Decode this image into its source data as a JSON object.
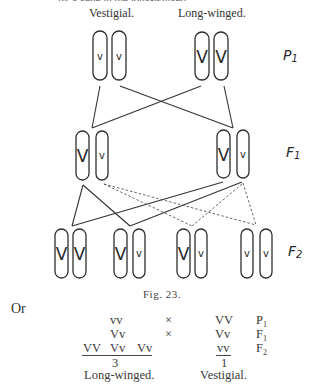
{
  "header": {
    "truncated_line": "...by a gene in the long-winged, ...",
    "left_label": "Vestigial.",
    "right_label": "Long-winged."
  },
  "generations": {
    "p1": "P",
    "p1_sub": "1",
    "f1": "F",
    "f1_sub": "1",
    "f2": "F",
    "f2_sub": "2"
  },
  "chromosomes": {
    "p1": [
      {
        "gene": "v"
      },
      {
        "gene": "v"
      },
      {
        "gene": "V"
      },
      {
        "gene": "V"
      }
    ],
    "f1": [
      {
        "gene": "V"
      },
      {
        "gene": "v"
      },
      {
        "gene": "V"
      },
      {
        "gene": "v"
      }
    ],
    "f2": [
      {
        "gene": "V"
      },
      {
        "gene": "V"
      },
      {
        "gene": "V"
      },
      {
        "gene": "v"
      },
      {
        "gene": "V"
      },
      {
        "gene": "v"
      },
      {
        "gene": "v"
      },
      {
        "gene": "v"
      }
    ]
  },
  "caption": "Fig. 23.",
  "or_label": "Or",
  "table": {
    "rows": [
      {
        "left": "vv",
        "op": "×",
        "right": "VV",
        "gen": "P",
        "gen_sub": "1"
      },
      {
        "left": "Vv",
        "op": "×",
        "right": "Vv",
        "gen": "F",
        "gen_sub": "1"
      },
      {
        "left_items": [
          "VV",
          "Vv",
          "Vv"
        ],
        "right": "vv",
        "gen": "F",
        "gen_sub": "2"
      }
    ],
    "left_count": "3",
    "right_count": "1",
    "left_result": "Long-winged.",
    "right_result": "Vestigial."
  }
}
